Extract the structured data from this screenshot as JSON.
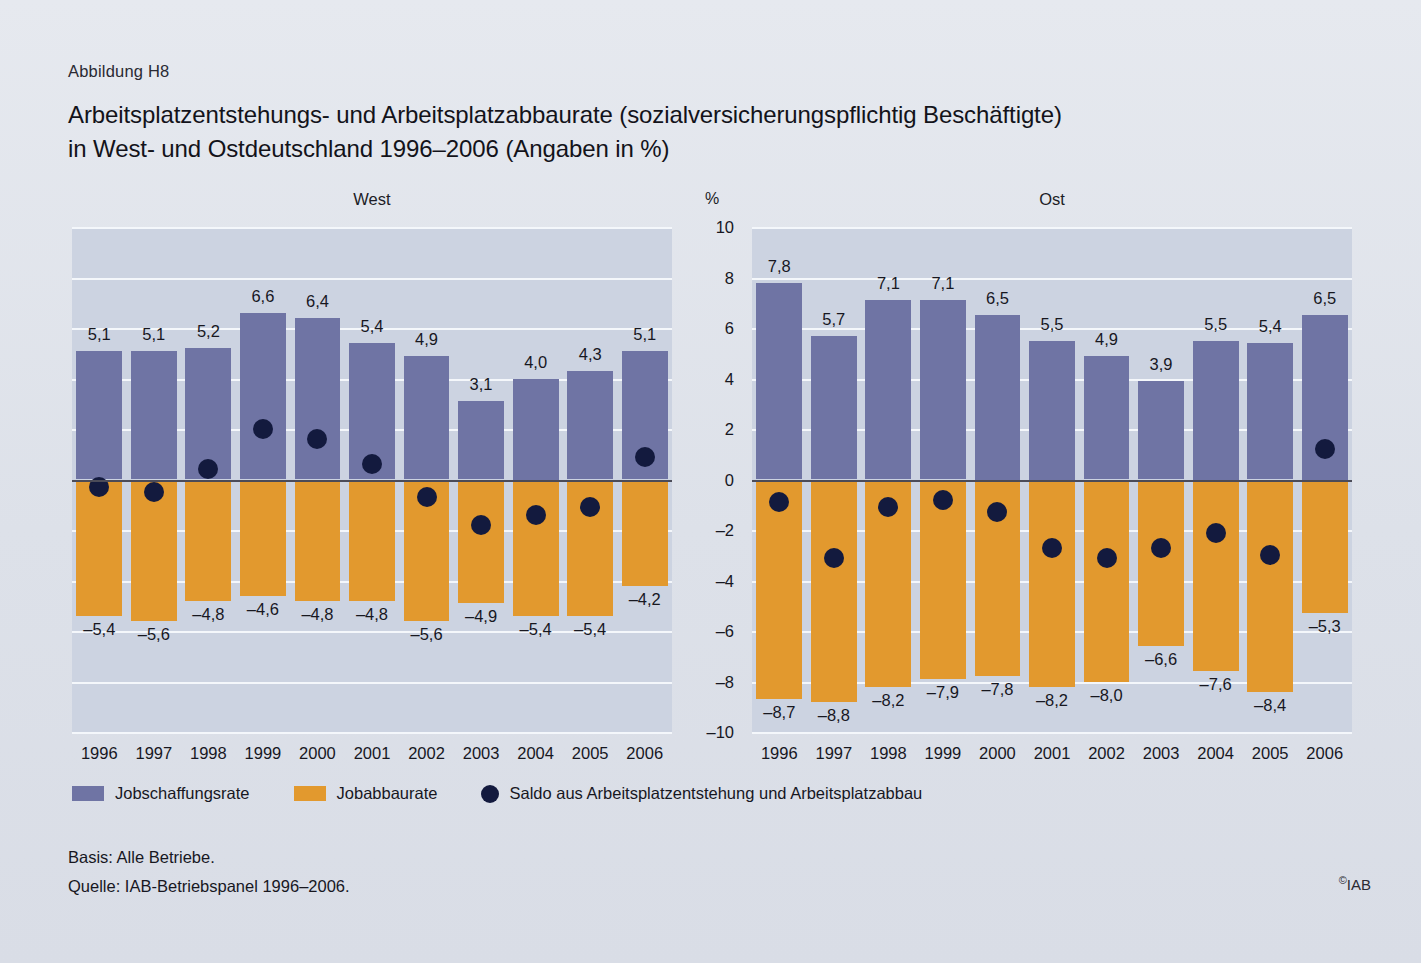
{
  "figure_number": "Abbildung H8",
  "title_line1": "Arbeitsplatzentstehungs- und Arbeitsplatzabbaurate (sozialversicherungspflichtig Beschäftigte)",
  "title_line2": "in West- und Ostdeutschland 1996–2006 (Angaben in %)",
  "unit_label": "%",
  "legend": {
    "creation_label": "Jobschaffungsrate",
    "destruction_label": "Jobabbaurate",
    "saldo_label": "Saldo aus Arbeitsplatzentstehung und Arbeitsplatzabbau"
  },
  "colors": {
    "job_creation": "#6f74a4",
    "job_destruction": "#e2992e",
    "saldo_dot": "#131a3e",
    "plot_background": "#ccd3e1",
    "gridline": "#f4f7fb",
    "zeroline": "#4b4b58",
    "page_background": "#e2e6ed"
  },
  "footer": {
    "basis": "Basis: Alle Betriebe.",
    "source": "Quelle: IAB-Betriebspanel 1996–2006.",
    "copyright": "IAB",
    "copyright_symbol": "©"
  },
  "chart_data": {
    "type": "bar",
    "title": "Arbeitsplatzentstehungs- und Arbeitsplatzabbaurate (sozialversicherungspflichtig Beschäftigte) in West- und Ostdeutschland 1996–2006 (Angaben in %)",
    "xlabel": "",
    "ylabel": "%",
    "ylim": [
      -10,
      10
    ],
    "yticks": [
      10,
      8,
      6,
      4,
      2,
      0,
      -2,
      -4,
      -6,
      -8,
      -10
    ],
    "ytick_labels": [
      "10",
      "8",
      "6",
      "4",
      "2",
      "0",
      "–2",
      "–4",
      "–6",
      "–8",
      "–10"
    ],
    "grid": true,
    "legend_position": "bottom-left",
    "categories": [
      "1996",
      "1997",
      "1998",
      "1999",
      "2000",
      "2001",
      "2002",
      "2003",
      "2004",
      "2005",
      "2006"
    ],
    "panels": [
      {
        "name": "West",
        "series": [
          {
            "name": "Jobschaffungsrate",
            "type": "bar",
            "color": "#6f74a4",
            "values": [
              5.1,
              5.1,
              5.2,
              6.6,
              6.4,
              5.4,
              4.9,
              3.1,
              4.0,
              4.3,
              5.1
            ],
            "labels": [
              "5,1",
              "5,1",
              "5,2",
              "6,6",
              "6,4",
              "5,4",
              "4,9",
              "3,1",
              "4,0",
              "4,3",
              "5,1"
            ]
          },
          {
            "name": "Jobabbaurate",
            "type": "bar",
            "color": "#e2992e",
            "values": [
              -5.4,
              -5.6,
              -4.8,
              -4.6,
              -4.8,
              -4.8,
              -5.6,
              -4.9,
              -5.4,
              -5.4,
              -4.2
            ],
            "labels": [
              "–5,4",
              "–5,6",
              "–4,8",
              "–4,6",
              "–4,8",
              "–4,8",
              "–5,6",
              "–4,9",
              "–5,4",
              "–5,4",
              "–4,2"
            ]
          },
          {
            "name": "Saldo aus Arbeitsplatzentstehung und Arbeitsplatzabbau",
            "type": "scatter",
            "color": "#131a3e",
            "values": [
              -0.3,
              -0.5,
              0.4,
              2.0,
              1.6,
              0.6,
              -0.7,
              -1.8,
              -1.4,
              -1.1,
              0.9
            ]
          }
        ]
      },
      {
        "name": "Ost",
        "series": [
          {
            "name": "Jobschaffungsrate",
            "type": "bar",
            "color": "#6f74a4",
            "values": [
              7.8,
              5.7,
              7.1,
              7.1,
              6.5,
              5.5,
              4.9,
              3.9,
              5.5,
              5.4,
              6.5
            ],
            "labels": [
              "7,8",
              "5,7",
              "7,1",
              "7,1",
              "6,5",
              "5,5",
              "4,9",
              "3,9",
              "5,5",
              "5,4",
              "6,5"
            ]
          },
          {
            "name": "Jobabbaurate",
            "type": "bar",
            "color": "#e2992e",
            "values": [
              -8.7,
              -8.8,
              -8.2,
              -7.9,
              -7.8,
              -8.2,
              -8.0,
              -6.6,
              -7.6,
              -8.4,
              -5.3
            ],
            "labels": [
              "–8,7",
              "–8,8",
              "–8,2",
              "–7,9",
              "–7,8",
              "–8,2",
              "–8,0",
              "–6,6",
              "–7,6",
              "–8,4",
              "–5,3"
            ]
          },
          {
            "name": "Saldo aus Arbeitsplatzentstehung und Arbeitsplatzabbau",
            "type": "scatter",
            "color": "#131a3e",
            "values": [
              -0.9,
              -3.1,
              -1.1,
              -0.8,
              -1.3,
              -2.7,
              -3.1,
              -2.7,
              -2.1,
              -3.0,
              1.2
            ]
          }
        ]
      }
    ]
  }
}
